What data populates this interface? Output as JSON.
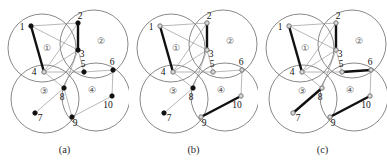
{
  "figure": {
    "width": 387,
    "height": 168,
    "background_color": "#ffffff",
    "panel_count": 3
  },
  "style": {
    "circle_stroke": "#6b6b6b",
    "circle_stroke_width": 0.8,
    "thin_edge_color": "#9a9a9a",
    "thin_edge_width": 0.7,
    "thick_edge_color": "#111111",
    "thick_edge_width": 2.4,
    "node_filled_color": "#111111",
    "node_hollow_fill": "#d9d9d9",
    "node_hollow_stroke": "#6b6b6b",
    "node_radius": 2.2,
    "label_color": "#111111",
    "cluster_label_color": "#555555"
  },
  "clusters": [
    {
      "id": "1",
      "label": "①",
      "cx": 42,
      "cy": 48,
      "r": 34,
      "label_x": 47,
      "label_y": 51
    },
    {
      "id": "2",
      "label": "②",
      "cx": 94,
      "cy": 44,
      "r": 34,
      "label_x": 101,
      "label_y": 44
    },
    {
      "id": "3",
      "label": "③",
      "cx": 45,
      "cy": 99,
      "r": 34,
      "label_x": 44,
      "label_y": 94
    },
    {
      "id": "4",
      "label": "④",
      "cx": 96,
      "cy": 97,
      "r": 34,
      "label_x": 92,
      "label_y": 93
    }
  ],
  "nodes": [
    {
      "id": "1",
      "x": 31,
      "y": 26,
      "label_dx": -9,
      "label_dy": 4
    },
    {
      "id": "2",
      "x": 78,
      "y": 23,
      "label_dx": 2,
      "label_dy": -4
    },
    {
      "id": "3",
      "x": 78,
      "y": 50,
      "label_dx": 4,
      "label_dy": 7
    },
    {
      "id": "4",
      "x": 44,
      "y": 72,
      "label_dx": -10,
      "label_dy": 3
    },
    {
      "id": "5",
      "x": 84,
      "y": 72,
      "label_dx": -1,
      "label_dy": -5
    },
    {
      "id": "6",
      "x": 113,
      "y": 70,
      "label_dx": -1,
      "label_dy": -5
    },
    {
      "id": "7",
      "x": 35,
      "y": 113,
      "label_dx": 5,
      "label_dy": 8
    },
    {
      "id": "8",
      "x": 64,
      "y": 88,
      "label_dx": -2,
      "label_dy": 12
    },
    {
      "id": "9",
      "x": 72,
      "y": 117,
      "label_dx": 3,
      "label_dy": 9
    },
    {
      "id": "10",
      "x": 112,
      "y": 96,
      "label_dx": -4,
      "label_dy": 12
    }
  ],
  "panels": [
    {
      "key": "a",
      "caption": "(a)",
      "thin_edges": [
        [
          "1",
          "2"
        ],
        [
          "1",
          "3"
        ],
        [
          "2",
          "3"
        ],
        [
          "1",
          "4"
        ],
        [
          "2",
          "4"
        ],
        [
          "3",
          "4"
        ],
        [
          "3",
          "8"
        ],
        [
          "4",
          "5"
        ],
        [
          "4",
          "8"
        ],
        [
          "3",
          "5"
        ],
        [
          "5",
          "6"
        ],
        [
          "6",
          "10"
        ],
        [
          "9",
          "10"
        ],
        [
          "7",
          "8"
        ],
        [
          "8",
          "9"
        ]
      ],
      "thick_edges": [
        [
          "1",
          "4"
        ],
        [
          "2",
          "3"
        ]
      ],
      "filled_nodes": [
        "1",
        "2",
        "3",
        "5",
        "6",
        "7",
        "8",
        "9",
        "10"
      ],
      "hollow_nodes": [
        "4"
      ]
    },
    {
      "key": "b",
      "caption": "(b)",
      "thin_edges": [
        [
          "1",
          "2"
        ],
        [
          "1",
          "3"
        ],
        [
          "2",
          "3"
        ],
        [
          "1",
          "4"
        ],
        [
          "2",
          "4"
        ],
        [
          "3",
          "4"
        ],
        [
          "3",
          "8"
        ],
        [
          "4",
          "5"
        ],
        [
          "4",
          "8"
        ],
        [
          "3",
          "5"
        ],
        [
          "5",
          "6"
        ],
        [
          "6",
          "10"
        ],
        [
          "7",
          "8"
        ]
      ],
      "thick_edges": [
        [
          "1",
          "4"
        ],
        [
          "2",
          "3"
        ],
        [
          "9",
          "10"
        ]
      ],
      "filled_nodes": [
        "7",
        "8"
      ],
      "hollow_nodes": [
        "1",
        "2",
        "3",
        "4",
        "5",
        "6",
        "9",
        "10"
      ]
    },
    {
      "key": "c",
      "caption": "(c)",
      "thin_edges": [
        [
          "1",
          "2"
        ],
        [
          "1",
          "3"
        ],
        [
          "2",
          "3"
        ],
        [
          "1",
          "4"
        ],
        [
          "2",
          "4"
        ],
        [
          "3",
          "4"
        ],
        [
          "3",
          "8"
        ],
        [
          "4",
          "5"
        ],
        [
          "4",
          "8"
        ],
        [
          "3",
          "5"
        ],
        [
          "6",
          "10"
        ]
      ],
      "thick_edges": [
        [
          "1",
          "4"
        ],
        [
          "2",
          "3"
        ],
        [
          "5",
          "6"
        ],
        [
          "7",
          "8"
        ],
        [
          "9",
          "10"
        ]
      ],
      "filled_nodes": [],
      "hollow_nodes": [
        "1",
        "2",
        "3",
        "4",
        "5",
        "6",
        "7",
        "8",
        "9",
        "10"
      ]
    }
  ]
}
